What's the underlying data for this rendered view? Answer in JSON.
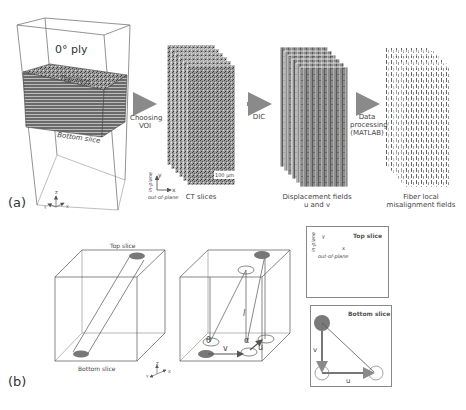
{
  "panel_a": {
    "label": "(a)",
    "specimen": {
      "title": "0° ply",
      "top_slice": "Top slice",
      "bottom_slice": "Bottom slice"
    },
    "axes": {
      "z": "Z",
      "y": "Y",
      "x": "X"
    },
    "steps": [
      {
        "arrow_label": "Choosing\nVOI",
        "caption": "CT slices"
      },
      {
        "arrow_label": "DIC",
        "caption": "Displacement fields\nu and v"
      },
      {
        "arrow_label": "Data\nprocessing\n(MATLAB)",
        "caption": "Fiber local\nmisalignment fields"
      }
    ],
    "ct_axes": {
      "y": "y",
      "x": "x",
      "in_plane": "in-plane",
      "out_of_plane": "out-of-plane"
    },
    "scale_bar": "100 µm"
  },
  "panel_b": {
    "label": "(b)",
    "cube1": {
      "top_slice": "Top slice",
      "bottom_slice": "Bottom slice"
    },
    "cube2": {
      "theta": "θ",
      "alpha": "α",
      "l": "l",
      "v": "v",
      "u": "u"
    },
    "axes": {
      "z": "Z",
      "y": "Y",
      "x": "X"
    },
    "top_box": {
      "title": "Top slice",
      "y": "y",
      "x": "x",
      "in_plane": "in-plane",
      "out_of_plane": "out-of-plane"
    },
    "bottom_box": {
      "title": "Bottom slice",
      "v": "v",
      "u": "u"
    }
  },
  "colors": {
    "arrow": "#8a8a8a",
    "dot": "#7a7a7a",
    "line": "#555555"
  }
}
